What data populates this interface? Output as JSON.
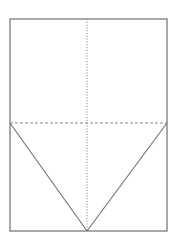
{
  "diagram": {
    "type": "origami-fold-diagram",
    "colors": {
      "background": "#ffffff",
      "paper_edge": "#7a7a7a",
      "fold_line": "#8a8a8a",
      "crease_line": "#777777"
    },
    "paper": {
      "x": 10,
      "y": 19,
      "width": 157,
      "height": 212
    },
    "lines": [
      {
        "id": "vertical-center-crease",
        "style": "dotted",
        "x1": 87,
        "y1": 19,
        "x2": 87,
        "y2": 231
      },
      {
        "id": "horizontal-fold",
        "style": "dashed",
        "x1": 10,
        "y1": 123,
        "x2": 167,
        "y2": 123
      },
      {
        "id": "left-diagonal",
        "style": "solid",
        "x1": 10,
        "y1": 123,
        "x2": 87,
        "y2": 231
      },
      {
        "id": "right-diagonal",
        "style": "solid",
        "x1": 167,
        "y1": 123,
        "x2": 87,
        "y2": 231
      }
    ]
  }
}
